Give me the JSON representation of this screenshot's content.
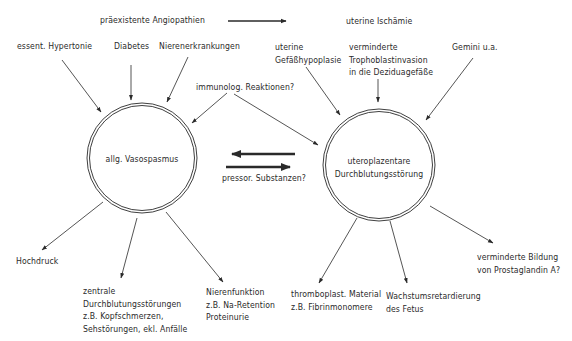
{
  "diagram": {
    "top_causes": {
      "preexisting": "präexistente Angiopathien",
      "uterine_ischemia": "uterine Ischämie"
    },
    "left_inputs": [
      {
        "label": "essent. Hypertonie"
      },
      {
        "label": "Diabetes"
      },
      {
        "label": "Nierenerkrankungen"
      }
    ],
    "right_inputs": [
      {
        "lines": [
          "uterine",
          "Gefäßhypoplasie"
        ]
      },
      {
        "lines": [
          "verminderte",
          "Trophoblastinvasion",
          "in die Deziduagefäße"
        ]
      },
      {
        "label": "Gemini u.a."
      }
    ],
    "immunolog": "immunolog. Reaktionen?",
    "left_node": "allg. Vasospasmus",
    "right_node": {
      "lines": [
        "uteroplazentare",
        "Durchblutungsstörung"
      ]
    },
    "exchange_label": "pressor. Substanzen?",
    "left_outputs": [
      {
        "lines": [
          "Hochdruck"
        ]
      },
      {
        "lines": [
          "zentrale",
          "Durchblutungsstörungen",
          "z.B. Kopfschmerzen,",
          "Sehstörungen, ekl. Anfälle"
        ]
      },
      {
        "lines": [
          "Nierenfunktion",
          "z.B. Na-Retention",
          "Proteinurie"
        ]
      }
    ],
    "right_outputs": [
      {
        "lines": [
          "thromboplast. Material",
          "z.B. Fibrinmonomere"
        ]
      },
      {
        "lines": [
          "Wachstumsretardierung",
          "des Fetus"
        ]
      },
      {
        "lines": [
          "verminderte Bildung",
          "von Prostaglandin A?"
        ]
      }
    ],
    "colors": {
      "ink": "#2a2a2a",
      "background": "#ffffff"
    }
  }
}
